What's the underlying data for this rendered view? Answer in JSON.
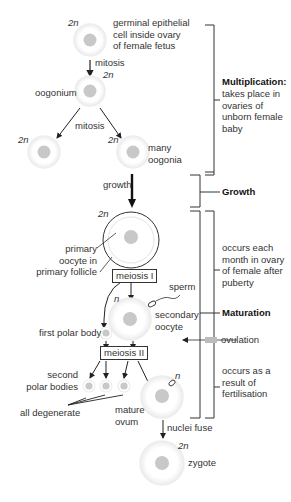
{
  "diagram": {
    "colors": {
      "nucleus": "#c8c8c8",
      "cell_edge": "#ececec",
      "line": "#333333",
      "text": "#333333"
    },
    "cells": {
      "germinal": {
        "ploidy": "2n",
        "label": "germinal epithelial\ncell inside ovary\nof female fetus"
      },
      "oogonium": {
        "ploidy": "2n",
        "label": "oogonium"
      },
      "oogonia_left": {
        "ploidy": "2n"
      },
      "oogonia_right": {
        "ploidy": "2n",
        "label": "many\noogonia"
      },
      "primary_oocyte": {
        "ploidy": "2n",
        "label": "primary\noocyte in\nprimary follicle"
      },
      "secondary_oocyte": {
        "ploidy": "n",
        "label": "secondary\noocyte"
      },
      "first_polar_body": {
        "label": "first polar body"
      },
      "second_polar_bodies": {
        "label": "second\npolar bodies"
      },
      "mature_ovum": {
        "ploidy": "n",
        "label": "mature\novum"
      },
      "zygote": {
        "ploidy": "2n",
        "label": "zygote"
      }
    },
    "arrows": {
      "mitosis_1": "mitosis",
      "mitosis_2": "mitosis",
      "growth": "growth",
      "meiosis_1": "meiosis I",
      "meiosis_2": "meiosis II",
      "sperm": "sperm",
      "all_degenerate": "all degenerate",
      "nuclei_fuse": "nuclei fuse",
      "ovulation": "ovulation"
    },
    "stages": {
      "multiplication": {
        "title": "Multiplication:",
        "desc": "takes place in\novaries of\nunborn female\nbaby"
      },
      "growth": {
        "title": "Growth"
      },
      "maturation": {
        "title": "Maturation",
        "desc_before": "occurs each\nmonth in ovary\nof female after\npuberty",
        "desc_after": "occurs as a\nresult of\nfertilisation"
      }
    }
  }
}
